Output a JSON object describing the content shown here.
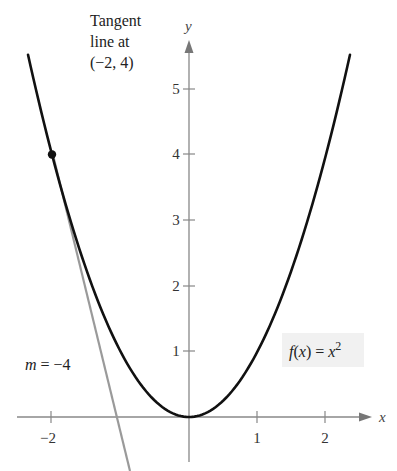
{
  "chart_data": {
    "type": "line",
    "title": "",
    "xlabel": "x",
    "ylabel": "y",
    "xlim": [
      -2.7,
      2.9
    ],
    "ylim": [
      -0.8,
      6.3
    ],
    "grid": false,
    "x_ticks": [
      -2,
      1,
      2
    ],
    "x_tick_labels": [
      "−2",
      "1",
      "2"
    ],
    "y_ticks": [
      1,
      2,
      3,
      4,
      5
    ],
    "y_tick_labels": [
      "1",
      "2",
      "3",
      "4",
      "5"
    ],
    "series": [
      {
        "name": "f(x) = x^2",
        "kind": "curve",
        "color": "#111111",
        "x": [
          -2.35,
          -2,
          -1.5,
          -1,
          -0.5,
          0,
          0.5,
          1,
          1.5,
          2,
          2.35
        ],
        "y": [
          5.52,
          4,
          2.25,
          1,
          0.25,
          0,
          0.25,
          1,
          2.25,
          4,
          5.52
        ]
      },
      {
        "name": "Tangent line at (-2, 4)",
        "kind": "line",
        "color": "#9a9a9a",
        "slope": -4,
        "intercept": -4,
        "x": [
          -2,
          -0.8
        ],
        "y": [
          4,
          -0.8
        ]
      }
    ],
    "points": [
      {
        "label": "(-2, 4)",
        "x": -2,
        "y": 4,
        "color": "#111111"
      }
    ],
    "annotations": [
      {
        "text_lines": [
          "Tangent",
          "line at",
          "(−2, 4)"
        ]
      },
      {
        "text": "m = −4",
        "var": "m",
        "rest": " = −4"
      },
      {
        "text": "f(x) = x²",
        "fn": "f",
        "arg": "x",
        "base": "x",
        "exp": "2"
      }
    ]
  },
  "labels": {
    "x_axis": "x",
    "y_axis": "y",
    "tangent_l1": "Tangent",
    "tangent_l2": "line at",
    "tangent_l3": "(−2, 4)",
    "slope_var": "m",
    "slope_rest": " = −4",
    "fn_name": "f",
    "fn_open": "(",
    "fn_arg": "x",
    "fn_close": ") = ",
    "fn_base": "x",
    "fn_exp": "2",
    "xt_m2": "−2",
    "xt_1": "1",
    "xt_2": "2",
    "yt_1": "1",
    "yt_2": "2",
    "yt_3": "3",
    "yt_4": "4",
    "yt_5": "5"
  },
  "colors": {
    "curve": "#111111",
    "tangent": "#9a9a9a",
    "axis": "#888888",
    "label_box": "#f1f1f1"
  }
}
